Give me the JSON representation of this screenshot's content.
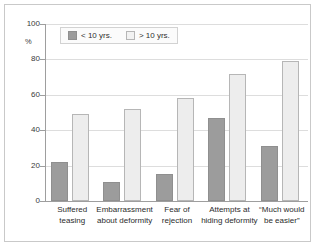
{
  "chart_data": {
    "type": "bar",
    "title": "",
    "xlabel": "",
    "ylabel": "%",
    "ylim": [
      0,
      100
    ],
    "grid": true,
    "legend_position": "top-left",
    "categories": [
      "Suffered teasing",
      "Embarrassment about deformity",
      "Fear of rejection",
      "Attempts at hiding deformity",
      "“Much would be easier”"
    ],
    "category_lines": [
      [
        "Suffered",
        "teasing"
      ],
      [
        "Embarrassment",
        "about deformity"
      ],
      [
        "Fear of",
        "rejection"
      ],
      [
        "Attempts at",
        "hiding deformity"
      ],
      [
        "“Much would",
        "be easier”"
      ]
    ],
    "series": [
      {
        "name": "< 10 yrs.",
        "color": "#9c9c9c",
        "values": [
          22,
          11,
          15,
          47,
          31
        ]
      },
      {
        "name": "> 10 yrs.",
        "color": "#ededed",
        "values": [
          49,
          52,
          58,
          72,
          79
        ]
      }
    ],
    "y_ticks": [
      0,
      20,
      40,
      60,
      80,
      100
    ],
    "y_tick_labels": [
      "0",
      "20",
      "40",
      "60",
      "80",
      "100"
    ]
  },
  "legend": {
    "entries": [
      {
        "label": "< 10 yrs."
      },
      {
        "label": "> 10 yrs."
      }
    ]
  },
  "axes": {
    "y_unit": "%"
  }
}
